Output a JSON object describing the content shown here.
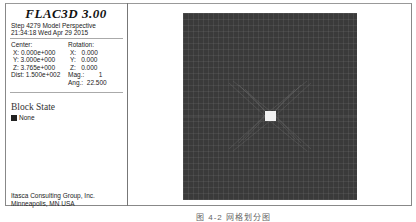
{
  "header": {
    "title": "FLAC3D 3.00",
    "step_line": "Step 4279  Model Perspective",
    "time_line": "21:34:18 Wed Apr 29 2015"
  },
  "view_params": {
    "center_label": "Center:",
    "center_x": "X: 0.000e+000",
    "center_y": "Y: 3.000e+000",
    "center_z": "Z: 3.765e+000",
    "dist": "Dist: 1.500e+002",
    "rotation_label": "Rotation:",
    "rot_x": "X:   0.000",
    "rot_y": "Y:   0.000",
    "rot_z": "Z:   0.000",
    "mag": "Mag.:        1",
    "ang": "Ang.:  22.500"
  },
  "legend": {
    "title": "Block State",
    "items": [
      {
        "label": "None",
        "color": "#222222"
      }
    ]
  },
  "footer": {
    "line1": "Itasca Consulting Group, Inc.",
    "line2": "Minneapolis, MN  USA"
  },
  "model_view": {
    "background": "#3a3a3a",
    "mesh_color": "#8a8a8a",
    "opening_color": "#f2f2f2"
  },
  "caption": "图 4-2   网格划分图"
}
